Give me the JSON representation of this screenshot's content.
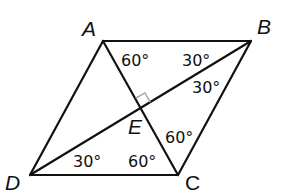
{
  "figure": {
    "type": "rhombus-with-diagonals",
    "vertices": {
      "A": {
        "label": "A",
        "x": 103,
        "y": 41
      },
      "B": {
        "label": "B",
        "x": 251,
        "y": 41
      },
      "C": {
        "label": "C",
        "x": 178,
        "y": 175
      },
      "D": {
        "label": "D",
        "x": 30,
        "y": 175
      },
      "E": {
        "label": "E",
        "x": 141,
        "y": 108
      }
    },
    "angle_labels": [
      {
        "id": "angle-BAE",
        "text": "60°"
      },
      {
        "id": "angle-ABE",
        "text": "30°"
      },
      {
        "id": "angle-EBC",
        "text": "30°"
      },
      {
        "id": "angle-ECB",
        "text": "60°"
      },
      {
        "id": "angle-EDC",
        "text": "30°"
      },
      {
        "id": "angle-ECD",
        "text": "60°"
      }
    ],
    "right_angle_at": "E",
    "colors": {
      "stroke": "#111111",
      "right_angle_marker": "#9a9a9a"
    }
  }
}
